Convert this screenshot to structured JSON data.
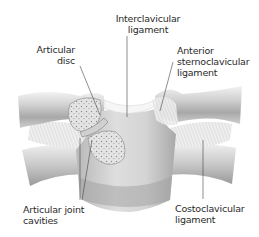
{
  "diagram": {
    "labels": {
      "interclavicular": {
        "line1": "Interclavicular",
        "line2": "ligament"
      },
      "articular_disc": {
        "line1": "Articular",
        "line2": "disc"
      },
      "anterior_sternoclavicular": {
        "line1": "Anterior",
        "line2": "sternoclavicular",
        "line3": "ligament"
      },
      "articular_joint_cavities": {
        "line1": "Articular joint",
        "line2": "cavities"
      },
      "costoclavicular": {
        "line1": "Costoclavicular",
        "line2": "ligament"
      }
    },
    "colors": {
      "background": "#ffffff",
      "bone_light": "#e6e6e6",
      "bone_mid": "#c4c4c4",
      "bone_dark": "#8a8a8a",
      "cancellous": "#dcdcdc",
      "text": "#2a2a2a",
      "leader_line": "#444444"
    }
  }
}
